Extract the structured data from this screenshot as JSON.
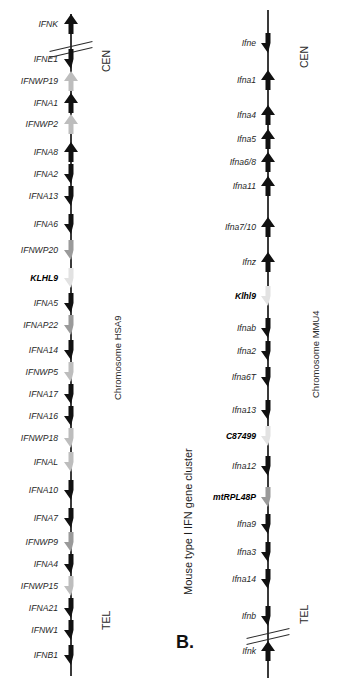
{
  "figure": {
    "caption_number": "Fig. 1.1.",
    "caption_lines": [
      "Fig. 1.1.  The human and murine type I IFN",
      "gene locus. (A) Human IFN gene cluster on",
      "Chromosome HSA9. (B) Mouse type I IFN gene",
      "cluster on Chromosome MMU4. Arrows indicate",
      "transcriptional orientation of genes. Black",
      "arrows indicate functional IFN genes, dark grey"
    ]
  },
  "panels": {
    "human": {
      "panel_letter": "A.",
      "cluster_title": "Human type I IFN gene cluster",
      "chromosome_label": "Chromosome HSA9",
      "centromere_label": "CEN",
      "telomere_label": "TEL",
      "genes": [
        {
          "name": "IFNK",
          "dir": "up",
          "color": "black",
          "bold": false,
          "y": 24
        },
        {
          "name": "IFNE1",
          "dir": "down",
          "color": "black",
          "bold": false,
          "y": 59
        },
        {
          "name": "IFNWP19",
          "dir": "up",
          "color": "lightgrey",
          "bold": false,
          "y": 81
        },
        {
          "name": "IFNA1",
          "dir": "up",
          "color": "black",
          "bold": false,
          "y": 103
        },
        {
          "name": "IFNWP2",
          "dir": "up",
          "color": "lightgrey",
          "bold": false,
          "y": 124
        },
        {
          "name": "IFNA8",
          "dir": "up",
          "color": "black",
          "bold": false,
          "y": 152
        },
        {
          "name": "IFNA2",
          "dir": "down",
          "color": "black",
          "bold": false,
          "y": 174
        },
        {
          "name": "IFNA13",
          "dir": "down",
          "color": "black",
          "bold": false,
          "y": 196
        },
        {
          "name": "IFNA6",
          "dir": "down",
          "color": "black",
          "bold": false,
          "y": 224
        },
        {
          "name": "IFNWP20",
          "dir": "down",
          "color": "grey",
          "bold": false,
          "y": 250
        },
        {
          "name": "KLHL9",
          "dir": "down",
          "color": "verylight",
          "bold": true,
          "y": 278
        },
        {
          "name": "IFNA5",
          "dir": "down",
          "color": "black",
          "bold": false,
          "y": 303
        },
        {
          "name": "IFNAP22",
          "dir": "down",
          "color": "grey",
          "bold": false,
          "y": 325
        },
        {
          "name": "IFNA14",
          "dir": "down",
          "color": "black",
          "bold": false,
          "y": 350
        },
        {
          "name": "IFNWP5",
          "dir": "down",
          "color": "lightgrey",
          "bold": false,
          "y": 372
        },
        {
          "name": "IFNA17",
          "dir": "down",
          "color": "black",
          "bold": false,
          "y": 394
        },
        {
          "name": "IFNA16",
          "dir": "down",
          "color": "black",
          "bold": false,
          "y": 416
        },
        {
          "name": "IFNWP18",
          "dir": "down",
          "color": "lightgrey",
          "bold": false,
          "y": 438
        },
        {
          "name": "IFNAL",
          "dir": "down",
          "color": "lightgrey",
          "bold": false,
          "y": 462
        },
        {
          "name": "IFNA10",
          "dir": "down",
          "color": "black",
          "bold": false,
          "y": 490
        },
        {
          "name": "IFNA7",
          "dir": "down",
          "color": "black",
          "bold": false,
          "y": 518
        },
        {
          "name": "IFNWP9",
          "dir": "down",
          "color": "grey",
          "bold": false,
          "y": 542
        },
        {
          "name": "IFNA4",
          "dir": "down",
          "color": "black",
          "bold": false,
          "y": 564
        },
        {
          "name": "IFNWP15",
          "dir": "down",
          "color": "lightgrey",
          "bold": false,
          "y": 586
        },
        {
          "name": "IFNA21",
          "dir": "down",
          "color": "black",
          "bold": false,
          "y": 608
        },
        {
          "name": "IFNW1",
          "dir": "down",
          "color": "black",
          "bold": false,
          "y": 630
        },
        {
          "name": "IFNB1",
          "dir": "down",
          "color": "black",
          "bold": false,
          "y": 655
        }
      ]
    },
    "mouse": {
      "panel_letter": "B.",
      "cluster_title": "Mouse type I IFN gene cluster",
      "chromosome_label": "Chromosome MMU4",
      "centromere_label": "CEN",
      "telomere_label": "TEL",
      "genes": [
        {
          "name": "Ifne",
          "dir": "down",
          "color": "black",
          "bold": false,
          "y": 43
        },
        {
          "name": "Ifna1",
          "dir": "up",
          "color": "black",
          "bold": false,
          "y": 80
        },
        {
          "name": "Ifna4",
          "dir": "up",
          "color": "black",
          "bold": false,
          "y": 115
        },
        {
          "name": "Ifna5",
          "dir": "up",
          "color": "black",
          "bold": false,
          "y": 139
        },
        {
          "name": "Ifna6/8",
          "dir": "up",
          "color": "black",
          "bold": false,
          "y": 162
        },
        {
          "name": "Ifna11",
          "dir": "up",
          "color": "black",
          "bold": false,
          "y": 186
        },
        {
          "name": "Ifna7/10",
          "dir": "up",
          "color": "black",
          "bold": false,
          "y": 227
        },
        {
          "name": "Ifnz",
          "dir": "up",
          "color": "black",
          "bold": false,
          "y": 262
        },
        {
          "name": "Klhl9",
          "dir": "down",
          "color": "verylight",
          "bold": true,
          "y": 296
        },
        {
          "name": "Ifnab",
          "dir": "down",
          "color": "black",
          "bold": false,
          "y": 328
        },
        {
          "name": "Ifna2",
          "dir": "down",
          "color": "black",
          "bold": false,
          "y": 351
        },
        {
          "name": "Ifna6T",
          "dir": "down",
          "color": "black",
          "bold": false,
          "y": 377
        },
        {
          "name": "Ifna13",
          "dir": "down",
          "color": "black",
          "bold": false,
          "y": 410
        },
        {
          "name": "C87499",
          "dir": "down",
          "color": "verylight",
          "bold": true,
          "y": 436
        },
        {
          "name": "Ifna12",
          "dir": "down",
          "color": "black",
          "bold": false,
          "y": 466
        },
        {
          "name": "mtRPL48P",
          "dir": "down",
          "color": "grey",
          "bold": true,
          "y": 497
        },
        {
          "name": "Ifna9",
          "dir": "down",
          "color": "black",
          "bold": false,
          "y": 524
        },
        {
          "name": "Ifna3",
          "dir": "down",
          "color": "black",
          "bold": false,
          "y": 552
        },
        {
          "name": "Ifna14",
          "dir": "down",
          "color": "black",
          "bold": false,
          "y": 579
        },
        {
          "name": "Ifnb",
          "dir": "down",
          "color": "black",
          "bold": false,
          "y": 616
        },
        {
          "name": "Ifnk",
          "dir": "up",
          "color": "black",
          "bold": false,
          "y": 651
        }
      ]
    }
  },
  "colors": {
    "black": "#111111",
    "grey": "#9a9a9a",
    "lightgrey": "#bdbdbd",
    "verylight": "#e2e2e2",
    "axis": "#3a3a3a",
    "text": "#1c1c1c"
  }
}
